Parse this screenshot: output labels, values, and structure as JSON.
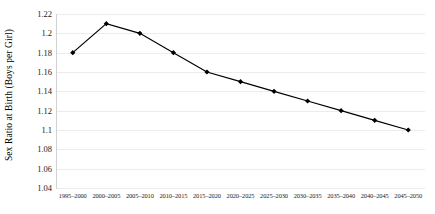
{
  "chart_data": {
    "type": "line",
    "title": "",
    "xlabel": "",
    "ylabel": "Sex Ratio at Birth (Boys per Girl)",
    "categories": [
      "1995–2000",
      "2000–2005",
      "2005–2010",
      "2010–2015",
      "2015–2020",
      "2020–2025",
      "2025–2030",
      "2030–2035",
      "2035–2040",
      "2040–2045",
      "2045–2050"
    ],
    "values": [
      1.18,
      1.21,
      1.2,
      1.18,
      1.16,
      1.15,
      1.14,
      1.13,
      1.12,
      1.11,
      1.1
    ],
    "ylim": [
      1.04,
      1.22
    ],
    "ytick_labels": [
      "1.22",
      "1.2",
      "1.18",
      "1.16",
      "1.14",
      "1.12",
      "1.1",
      "1.08",
      "1.06",
      "1.04"
    ],
    "ytick_values": [
      1.22,
      1.2,
      1.18,
      1.16,
      1.14,
      1.12,
      1.1,
      1.08,
      1.06,
      1.04
    ],
    "grid": true,
    "legend": "none",
    "series_color": "#000000",
    "gridline_color": "#ECECED",
    "marker": "diamond"
  }
}
